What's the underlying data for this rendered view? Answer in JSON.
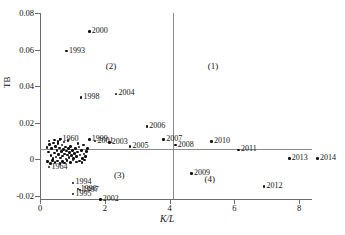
{
  "chart_data": {
    "type": "scatter",
    "title": "",
    "xlabel": "K/L",
    "ylabel": "TB",
    "xlim": [
      0,
      8.9
    ],
    "ylim": [
      -0.023,
      0.08
    ],
    "grid": false,
    "legend": "none",
    "xticks": [
      "0",
      "2",
      "4",
      "6",
      "8"
    ],
    "xtick_values": [
      0,
      2,
      4,
      6,
      8
    ],
    "yticks": [
      "0.08",
      "0.06",
      "0.04",
      "0.02",
      "0",
      "-0.02"
    ],
    "ytick_values": [
      0.08,
      0.06,
      0.04,
      0.02,
      0,
      -0.02
    ],
    "reference_lines": [
      {
        "name": "horizontal-zero-line",
        "axis": "y",
        "value": 0
      },
      {
        "name": "vertical-divider-line",
        "axis": "x",
        "value": 4.1
      }
    ],
    "quadrant_labels": [
      {
        "label": "(1)",
        "x": 5.4,
        "y": 0.0505
      },
      {
        "label": "(2)",
        "x": 2.25,
        "y": 0.0505
      },
      {
        "label": "(3)",
        "x": 2.5,
        "y": -0.0092
      },
      {
        "label": "(4)",
        "x": 5.3,
        "y": -0.0112
      }
    ],
    "points": [
      {
        "label": "2000",
        "x": 1.52,
        "y": 0.07,
        "label_pos": "right"
      },
      {
        "label": "1993",
        "x": 0.82,
        "y": 0.0592,
        "label_pos": "right"
      },
      {
        "label": "1998",
        "x": 1.27,
        "y": 0.0338,
        "label_pos": "right"
      },
      {
        "label": "2004",
        "x": 2.35,
        "y": 0.0358,
        "label_pos": "right"
      },
      {
        "label": "2006",
        "x": 3.3,
        "y": 0.018,
        "label_pos": "right"
      },
      {
        "label": "2007",
        "x": 3.82,
        "y": 0.0108,
        "label_pos": "right"
      },
      {
        "label": "2008",
        "x": 4.18,
        "y": 0.0078,
        "label_pos": "right"
      },
      {
        "label": "2010",
        "x": 5.3,
        "y": 0.0098,
        "label_pos": "right"
      },
      {
        "label": "2011",
        "x": 6.13,
        "y": 0.0052,
        "label_pos": "right"
      },
      {
        "label": "2013",
        "x": 7.7,
        "y": 0.0005,
        "label_pos": "right"
      },
      {
        "label": "2014",
        "x": 8.57,
        "y": 0.0005,
        "label_pos": "right"
      },
      {
        "label": "2009",
        "x": 4.68,
        "y": -0.0078,
        "label_pos": "right"
      },
      {
        "label": "2012",
        "x": 6.92,
        "y": -0.0148,
        "label_pos": "right"
      },
      {
        "label": "1999",
        "x": 1.52,
        "y": 0.0108,
        "label_pos": "right"
      },
      {
        "label": "2001",
        "x": 1.7,
        "y": 0.01,
        "label_pos": "right"
      },
      {
        "label": "2003",
        "x": 2.14,
        "y": 0.0092,
        "label_pos": "right"
      },
      {
        "label": "2005",
        "x": 2.78,
        "y": 0.0072,
        "label_pos": "right"
      },
      {
        "label": "1960",
        "x": 0.62,
        "y": 0.0108,
        "label_pos": "right"
      },
      {
        "label": "1964",
        "x": 0.28,
        "y": -0.0042,
        "label_pos": "right"
      },
      {
        "label": "1994",
        "x": 1.02,
        "y": -0.0128,
        "label_pos": "right"
      },
      {
        "label": "1996",
        "x": 1.18,
        "y": -0.0162,
        "label_pos": "right"
      },
      {
        "label": "1997",
        "x": 1.24,
        "y": -0.0168,
        "label_pos": "right"
      },
      {
        "label": "1995",
        "x": 1.02,
        "y": -0.019,
        "label_pos": "right"
      },
      {
        "label": "2002",
        "x": 1.86,
        "y": -0.0218,
        "label_pos": "right"
      }
    ],
    "cluster_points": [
      {
        "x": 0.22,
        "y": 0.0065
      },
      {
        "x": 0.26,
        "y": 0.004
      },
      {
        "x": 0.3,
        "y": 0.0082
      },
      {
        "x": 0.34,
        "y": 0.0022
      },
      {
        "x": 0.36,
        "y": 0.0058
      },
      {
        "x": 0.4,
        "y": 0.0005
      },
      {
        "x": 0.42,
        "y": 0.009
      },
      {
        "x": 0.45,
        "y": 0.0035
      },
      {
        "x": 0.48,
        "y": 0.007
      },
      {
        "x": 0.5,
        "y": 0.0012
      },
      {
        "x": 0.52,
        "y": 0.0048
      },
      {
        "x": 0.55,
        "y": 0.0088
      },
      {
        "x": 0.58,
        "y": 0.0028
      },
      {
        "x": 0.6,
        "y": 0.0062
      },
      {
        "x": 0.63,
        "y": 0.0008
      },
      {
        "x": 0.66,
        "y": 0.0042
      },
      {
        "x": 0.68,
        "y": 0.0078
      },
      {
        "x": 0.7,
        "y": 0.0018
      },
      {
        "x": 0.72,
        "y": 0.0055
      },
      {
        "x": 0.75,
        "y": 0.003
      },
      {
        "x": 0.78,
        "y": 0.0068
      },
      {
        "x": 0.8,
        "y": 0.0002
      },
      {
        "x": 0.82,
        "y": 0.0045
      },
      {
        "x": 0.85,
        "y": 0.0025
      },
      {
        "x": 0.88,
        "y": 0.006
      },
      {
        "x": 0.9,
        "y": 0.001
      },
      {
        "x": 0.92,
        "y": 0.0038
      },
      {
        "x": 0.95,
        "y": 0.0072
      },
      {
        "x": 0.98,
        "y": 0.002
      },
      {
        "x": 1.0,
        "y": 0.005
      },
      {
        "x": 1.03,
        "y": 0.0006
      },
      {
        "x": 1.06,
        "y": 0.0032
      },
      {
        "x": 1.1,
        "y": 0.0058
      },
      {
        "x": 1.13,
        "y": 0.0015
      },
      {
        "x": 1.16,
        "y": 0.004
      },
      {
        "x": 1.2,
        "y": 0.0068
      },
      {
        "x": 1.24,
        "y": 0.0024
      },
      {
        "x": 1.28,
        "y": 0.005
      },
      {
        "x": 1.32,
        "y": 0.0004
      },
      {
        "x": 1.36,
        "y": 0.003
      },
      {
        "x": 1.4,
        "y": 0.0015
      },
      {
        "x": 1.44,
        "y": 0.0042
      },
      {
        "x": 0.24,
        "y": -0.0012
      },
      {
        "x": 0.32,
        "y": -0.0022
      },
      {
        "x": 0.38,
        "y": -0.0005
      },
      {
        "x": 0.46,
        "y": -0.0018
      },
      {
        "x": 0.54,
        "y": -0.0008
      },
      {
        "x": 0.62,
        "y": -0.0024
      },
      {
        "x": 0.7,
        "y": -0.001
      },
      {
        "x": 0.76,
        "y": -0.002
      },
      {
        "x": 0.84,
        "y": -0.0006
      },
      {
        "x": 0.94,
        "y": -0.0016
      },
      {
        "x": 1.02,
        "y": -0.0004
      },
      {
        "x": 1.12,
        "y": -0.0014
      },
      {
        "x": 1.22,
        "y": -0.0008
      },
      {
        "x": 1.3,
        "y": -0.0018
      },
      {
        "x": 1.38,
        "y": -0.0003
      },
      {
        "x": 0.28,
        "y": 0.01
      },
      {
        "x": 0.44,
        "y": 0.0105
      },
      {
        "x": 0.56,
        "y": 0.0098
      },
      {
        "x": 0.64,
        "y": 0.0112
      },
      {
        "x": 0.74,
        "y": 0.0095
      },
      {
        "x": 0.86,
        "y": 0.0104
      },
      {
        "x": 1.18,
        "y": 0.0088
      },
      {
        "x": 1.34,
        "y": 0.0078
      },
      {
        "x": 1.46,
        "y": 0.006
      }
    ]
  }
}
